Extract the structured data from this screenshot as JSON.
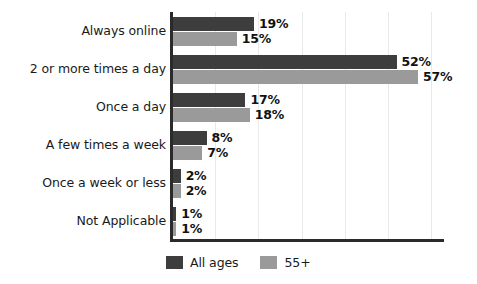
{
  "chart_data": {
    "type": "bar",
    "orientation": "horizontal",
    "title": "",
    "subtitle": "",
    "xlabel": "",
    "ylabel": "",
    "xlim": [
      0,
      63
    ],
    "grid": true,
    "grid_interval": 10,
    "value_suffix": "%",
    "legend_position": "bottom-left",
    "categories": [
      "Always online",
      "2 or more times a day",
      "Once a day",
      "A few times a week",
      "Once a week or less",
      "Not Applicable"
    ],
    "series": [
      {
        "name": "All ages",
        "color": "#3d3d3d",
        "values": [
          19,
          52,
          17,
          8,
          2,
          1
        ],
        "labels": [
          "19%",
          "52%",
          "17%",
          "8%",
          "2%",
          "1%"
        ]
      },
      {
        "name": "55+",
        "color": "#9a9a9a",
        "values": [
          15,
          57,
          18,
          7,
          2,
          1
        ],
        "labels": [
          "15%",
          "57%",
          "18%",
          "7%",
          "2%",
          "1%"
        ]
      }
    ]
  },
  "axis": {
    "line_color": "#2b2b2b",
    "gridline_color": "#e9e9e9"
  },
  "legend": {
    "entries": [
      {
        "label": "All ages",
        "color": "#3d3d3d"
      },
      {
        "label": "55+",
        "color": "#9a9a9a"
      }
    ]
  }
}
